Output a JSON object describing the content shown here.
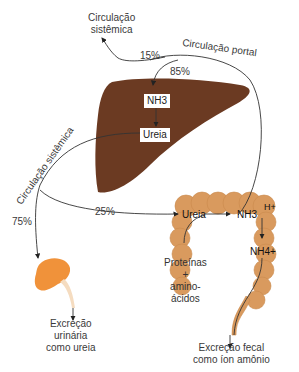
{
  "colors": {
    "liver": "#6b3a22",
    "intestine": "#d99a5e",
    "kidney": "#f0923a",
    "ureter": "#f5dcc0",
    "line": "#333333"
  },
  "labels": {
    "systemic_top": [
      "Circulação",
      "sistêmica"
    ],
    "portal": "Circulação portal",
    "systemic_left": "Circulação sistêmica",
    "pct_15": "15%",
    "pct_85": "85%",
    "pct_25": "25%",
    "pct_75": "75%",
    "nh3_liver": "NH3",
    "ureia_liver": "Ureia",
    "ureia_gut": "Ureia",
    "nh3_gut": "NH3",
    "h_plus": "H+",
    "nh4": "NH4+",
    "proteins": [
      "Proteínas",
      "+",
      "amino-",
      "ácidos"
    ],
    "urinary": [
      "Excreção",
      "urinária",
      "como ureia"
    ],
    "fecal": [
      "Excreção fecal",
      "como íon amônio"
    ]
  },
  "nodes": [
    {
      "id": "liver",
      "name": "Fígado"
    },
    {
      "id": "kidney",
      "name": "Rim"
    },
    {
      "id": "intestine",
      "name": "Intestino"
    }
  ]
}
